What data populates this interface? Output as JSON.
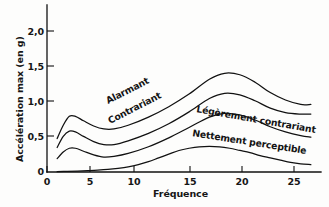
{
  "chart_data": {
    "type": "line",
    "title": "",
    "xlabel": "Fréquence",
    "ylabel": "Accélération max (en g)",
    "xlim": [
      0,
      27
    ],
    "ylim": [
      0,
      2.25
    ],
    "xticks": [
      0,
      5,
      10,
      15,
      20,
      25
    ],
    "xtick_labels": [
      "0",
      "5",
      "10",
      "15",
      "20",
      "25"
    ],
    "yticks": [
      0,
      0.5,
      1.0,
      1.5,
      2.0
    ],
    "ytick_labels": [
      "0",
      "0,5",
      "1,0",
      "1,5",
      "2,0"
    ],
    "grid": false,
    "legend": "inline-curve-labels",
    "series": [
      {
        "name": "Alarmant",
        "label": "Alarmant",
        "x": [
          1,
          1.6,
          2.2,
          2.8,
          3.6,
          4.6,
          5.6,
          6.6,
          8,
          10,
          12,
          14,
          16,
          17.5,
          19,
          20.5,
          22,
          23.5,
          25,
          26
        ],
        "values": [
          0.45,
          0.63,
          0.75,
          0.75,
          0.69,
          0.62,
          0.58,
          0.58,
          0.63,
          0.74,
          0.88,
          1.05,
          1.25,
          1.33,
          1.31,
          1.21,
          1.07,
          0.97,
          0.91,
          0.91
        ]
      },
      {
        "name": "Contrariant",
        "label": "Contrariant",
        "x": [
          1,
          1.6,
          2.2,
          2.8,
          3.6,
          4.6,
          5.6,
          6.6,
          8,
          10,
          12,
          14,
          16,
          17.5,
          19,
          20.5,
          22,
          23.5,
          25,
          26
        ],
        "values": [
          0.33,
          0.48,
          0.55,
          0.54,
          0.48,
          0.41,
          0.37,
          0.37,
          0.42,
          0.52,
          0.65,
          0.81,
          0.99,
          1.06,
          1.04,
          0.96,
          0.86,
          0.8,
          0.78,
          0.78
        ]
      },
      {
        "name": "Légèrement contrariant",
        "label": "Légèrement contrariant",
        "x": [
          1,
          1.6,
          2.2,
          2.8,
          3.6,
          4.6,
          5.6,
          6.6,
          8,
          10,
          12,
          14,
          16,
          17.5,
          19,
          20.5,
          22,
          23.5,
          25,
          26
        ],
        "values": [
          0.18,
          0.27,
          0.32,
          0.32,
          0.28,
          0.23,
          0.2,
          0.21,
          0.25,
          0.34,
          0.46,
          0.6,
          0.74,
          0.79,
          0.77,
          0.7,
          0.61,
          0.54,
          0.49,
          0.47
        ]
      },
      {
        "name": "Nettement perceptible",
        "label": "Nettement perceptible",
        "x": [
          1,
          2,
          3,
          4,
          5,
          6,
          7,
          8,
          9,
          10,
          11,
          12,
          13,
          14,
          15,
          16,
          17,
          18,
          19,
          20,
          21,
          22,
          23,
          24,
          25,
          26
        ],
        "values": [
          0.005,
          0.008,
          0.012,
          0.018,
          0.025,
          0.035,
          0.05,
          0.07,
          0.1,
          0.14,
          0.19,
          0.24,
          0.29,
          0.32,
          0.34,
          0.345,
          0.34,
          0.32,
          0.29,
          0.26,
          0.22,
          0.19,
          0.16,
          0.13,
          0.11,
          0.1
        ]
      }
    ]
  },
  "axes": {
    "xlabel": "Fréquence",
    "ylabel": "Accélération max (en g)",
    "ytick_0": "0",
    "ytick_1": "0,5",
    "ytick_2": "1,0",
    "ytick_3": "1,5",
    "ytick_4": "2,0",
    "xtick_0": "0",
    "xtick_1": "5",
    "xtick_2": "10",
    "xtick_3": "15",
    "xtick_4": "20",
    "xtick_5": "25"
  },
  "curve_labels": {
    "alarmant": "Alarmant",
    "contrariant": "Contrariant",
    "legerement_contrariant": "Légèrement contrariant",
    "nettement_perceptible": "Nettement perceptible"
  }
}
